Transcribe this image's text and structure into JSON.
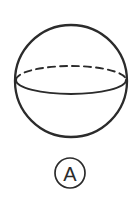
{
  "figure": {
    "caption_label": "A",
    "shape_name": "sphere",
    "background_color": "#ffffff",
    "stroke_color": "#2b2b2b",
    "canvas": {
      "width": 138,
      "height": 197
    },
    "sphere": {
      "center_x": 71,
      "center_y": 81,
      "radius": 56,
      "stroke_width": 2.3
    },
    "equator": {
      "center_x": 71,
      "center_y": 80,
      "radius_x": 55,
      "radius_y": 14,
      "front_arc_style": "solid",
      "back_arc_style": "dashed",
      "dash_pattern": "7 5"
    },
    "label_badge": {
      "center_x": 70,
      "center_y": 173,
      "radius": 15,
      "stroke_width": 1.7,
      "text": "A"
    }
  }
}
